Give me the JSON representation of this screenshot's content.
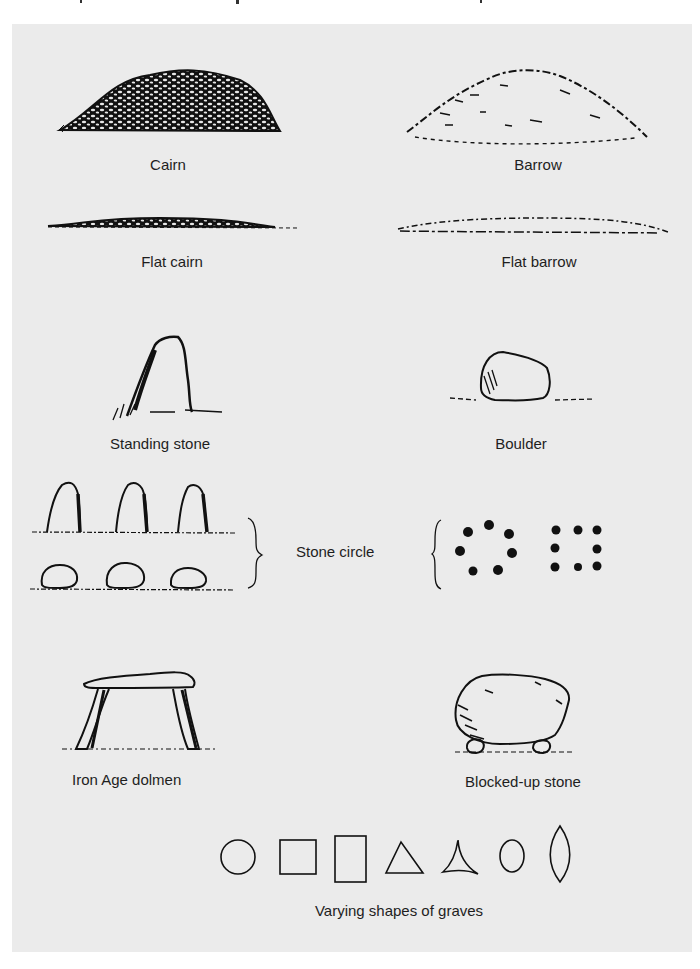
{
  "figure": {
    "background": "#ebebeb",
    "ink": "#111111",
    "labels": {
      "cairn": "Cairn",
      "barrow": "Barrow",
      "flat_cairn": "Flat cairn",
      "flat_barrow": "Flat barrow",
      "standing_stone": "Standing stone",
      "boulder": "Boulder",
      "stone_circle": "Stone circle",
      "iron_age_dolmen": "Iron Age dolmen",
      "blocked_up_stone": "Blocked-up stone",
      "grave_shapes": "Varying shapes of graves"
    },
    "grave_shapes": [
      "circle",
      "square",
      "rectangle",
      "triangle",
      "concave-triangle",
      "oval",
      "pointed-oval"
    ]
  }
}
